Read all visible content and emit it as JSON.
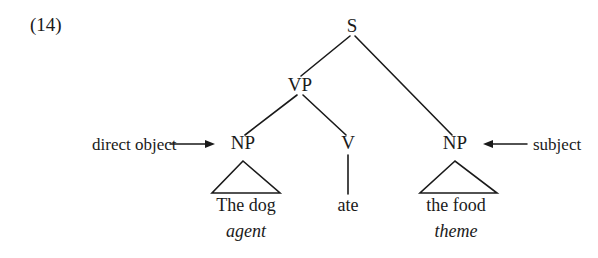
{
  "figure": {
    "example_number": "(14)",
    "sentence": "The dog ate the food"
  },
  "tree": {
    "nodes": [
      {
        "id": "s",
        "label": "S",
        "x": 352,
        "y": 28
      },
      {
        "id": "vp",
        "label": "VP",
        "x": 300,
        "y": 87
      },
      {
        "id": "np_l",
        "label": "NP",
        "x": 243,
        "y": 145
      },
      {
        "id": "v",
        "label": "V",
        "x": 348,
        "y": 145
      },
      {
        "id": "np_r",
        "label": "NP",
        "x": 455,
        "y": 145
      }
    ],
    "edges": [
      {
        "from": "s",
        "to": "vp"
      },
      {
        "from": "s",
        "to": "np_r"
      },
      {
        "from": "vp",
        "to": "np_l"
      },
      {
        "from": "vp",
        "to": "v"
      }
    ],
    "terminals": [
      {
        "id": "the_dog",
        "text": "The dog",
        "parent": "np_l",
        "shape": "triangle"
      },
      {
        "id": "ate",
        "text": "ate",
        "parent": "v",
        "shape": "line"
      },
      {
        "id": "the_food",
        "text": "the food",
        "parent": "np_r",
        "shape": "triangle"
      }
    ],
    "roles": [
      {
        "id": "agent",
        "label": "agent",
        "under": "the_dog"
      },
      {
        "id": "theme",
        "label": "theme",
        "under": "the_food"
      }
    ]
  },
  "annotations": [
    {
      "id": "direct_object",
      "label": "direct object",
      "arrow": "right-arrow",
      "points_to": "np_l"
    },
    {
      "id": "subject",
      "label": "subject",
      "arrow": "left-arrow",
      "points_to": "np_r"
    }
  ],
  "style": {
    "ink": "#1a1a1a",
    "background": "#ffffff"
  }
}
